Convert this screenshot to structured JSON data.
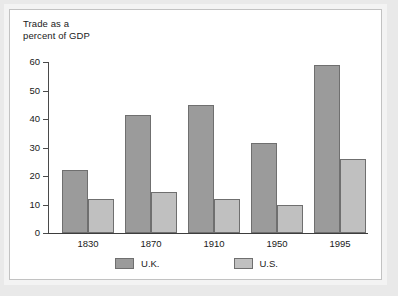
{
  "chart_data": {
    "type": "bar",
    "title": "",
    "ylabel": "Trade as a\npercent of GDP",
    "xlabel": "",
    "categories": [
      "1830",
      "1870",
      "1910",
      "1950",
      "1995"
    ],
    "series": [
      {
        "name": "U.K.",
        "values": [
          22,
          41.5,
          45,
          31.5,
          59
        ],
        "color": "#9b9b9b"
      },
      {
        "name": "U.S.",
        "values": [
          12,
          14.5,
          11.8,
          10,
          26
        ],
        "color": "#c0c0c0"
      }
    ],
    "ylim": [
      0,
      60
    ],
    "yticks": [
      0,
      10,
      20,
      30,
      40,
      50,
      60
    ],
    "ytick_labels": [
      "0",
      "10",
      "20",
      "30",
      "40",
      "50",
      "60"
    ],
    "grid": false,
    "legend_position": "bottom"
  },
  "axis": {
    "title_line1": "Trade as a",
    "title_line2": "percent of GDP",
    "y_ticks": [
      "60",
      "50",
      "40",
      "30",
      "20",
      "10",
      "0"
    ]
  },
  "categories": {
    "c0": "1830",
    "c1": "1870",
    "c2": "1910",
    "c3": "1950",
    "c4": "1995"
  },
  "legend": {
    "uk_label": "U.K.",
    "us_label": "U.S."
  },
  "colors": {
    "uk_bar": "#9b9b9b",
    "us_bar": "#c0c0c0",
    "bar_border": "#6f6f6f",
    "axis": "#3d3d3d",
    "panel_background": "#ffffff",
    "page_background": "#e9e9e9"
  }
}
